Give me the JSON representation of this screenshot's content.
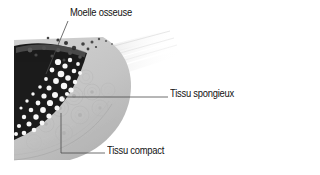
{
  "figure": {
    "title_alt": "Coupe d'os : moelle osseuse, tissu spongieux, tissu compact",
    "background_color": "#ffffff",
    "labels": [
      {
        "id": "marrow",
        "text": "Moelle osseuse",
        "x": 70,
        "y": 7,
        "leader": "diagonal-down-left",
        "target_x": 46,
        "target_y": 74
      },
      {
        "id": "spongy",
        "text": "Tissu spongieux",
        "x": 170,
        "y": 88,
        "leader": "horizontal-left",
        "target_x": 63,
        "target_y": 97
      },
      {
        "id": "compact",
        "text": "Tissu compact",
        "x": 107,
        "y": 145,
        "leader": "elbow-up-left",
        "target_x": 61,
        "target_y": 113
      }
    ],
    "colors": {
      "marrow": "#1b1b1b",
      "trabeculae": "#fbfbfb",
      "compact_bone": "#c9c9c9",
      "compact_rim": "#b0b0b0",
      "cut_plane": "#ececec",
      "leader_line": "#4a4a4a",
      "text": "#121212"
    },
    "regions": [
      {
        "name": "moelle-osseuse",
        "description": "zone sombre centrale, moelle"
      },
      {
        "name": "tissu-spongieux",
        "description": "travees osseuses claires en reseau"
      },
      {
        "name": "tissu-compact",
        "description": "couche externe grise avec osteones concentriques"
      },
      {
        "name": "plan-de-coupe",
        "description": "surface de section diagonale estompee"
      }
    ]
  }
}
